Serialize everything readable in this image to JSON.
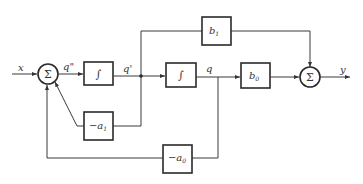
{
  "diagram": {
    "type": "block-diagram",
    "signals": {
      "input": "x",
      "q_double_prime": "q\"",
      "q_prime": "q'",
      "q": "q",
      "output": "y"
    },
    "summers": [
      {
        "id": "sum-input",
        "symbol": "Σ"
      },
      {
        "id": "sum-output",
        "symbol": "Σ"
      }
    ],
    "blocks": [
      {
        "id": "integrator-1",
        "symbol": "∫"
      },
      {
        "id": "integrator-2",
        "symbol": "∫"
      },
      {
        "id": "gain-b1",
        "base": "b",
        "sub": "1"
      },
      {
        "id": "gain-b0",
        "base": "b",
        "sub": "0"
      },
      {
        "id": "gain-neg-a1",
        "prefix": "−",
        "base": "a",
        "sub": "1"
      },
      {
        "id": "gain-neg-a0",
        "prefix": "−",
        "base": "a",
        "sub": "0"
      }
    ],
    "colors": {
      "line": "#3a3a3a",
      "background": "#ffffff"
    }
  }
}
